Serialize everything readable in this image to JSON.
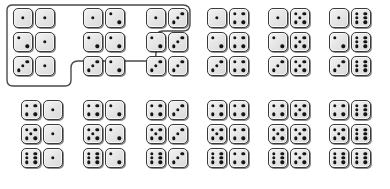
{
  "figure": {
    "type": "domino-set",
    "die_face_color": "#e9e9e9",
    "die_border_color": "#3a3a3a",
    "pip_color": "#141414",
    "outline_color": "#4a4a4a",
    "outline_fill": "none",
    "max_pips": 6,
    "domino_count": 28
  },
  "outline": {
    "name": "highlight-boundary",
    "description": "Rounded staircase outline enclosing the first twelve domino pairs in the upper block",
    "path": "M 7 10 Q 7 5 13 5 L 183 5 Q 190 5 190 12 L 190 24 Q 190 31 183 31 L 163 31 Q 156 31 156 38 L 156 54 Q 156 61 149 61 L 78 61 Q 71 61 71 68 L 71 80 Q 71 86 65 86 L 13 86 Q 7 86 7 80 Z"
  },
  "grid": {
    "top_block": {
      "rows": 3,
      "groups": [
        {
          "name": "group-ones",
          "x": 12,
          "y": 8,
          "pairs": [
            {
              "left": 1,
              "right": 1
            },
            {
              "left": 2,
              "right": 1
            },
            {
              "left": 3,
              "right": 1
            }
          ]
        },
        {
          "name": "group-twos",
          "x": 82,
          "y": 8,
          "pairs": [
            {
              "left": 1,
              "right": 2
            },
            {
              "left": 2,
              "right": 2
            },
            {
              "left": 3,
              "right": 2
            }
          ]
        },
        {
          "name": "group-threes",
          "x": 145,
          "y": 8,
          "pairs": [
            {
              "left": 1,
              "right": 3
            },
            {
              "left": 2,
              "right": 3
            },
            {
              "left": 3,
              "right": 3
            }
          ]
        },
        {
          "name": "group-fours",
          "x": 206,
          "y": 8,
          "pairs": [
            {
              "left": 1,
              "right": 4
            },
            {
              "left": 2,
              "right": 4
            },
            {
              "left": 3,
              "right": 4
            }
          ]
        },
        {
          "name": "group-fives",
          "x": 267,
          "y": 8,
          "pairs": [
            {
              "left": 1,
              "right": 5
            },
            {
              "left": 2,
              "right": 5
            },
            {
              "left": 3,
              "right": 5
            }
          ]
        },
        {
          "name": "group-sixes",
          "x": 328,
          "y": 8,
          "pairs": [
            {
              "left": 1,
              "right": 6
            },
            {
              "left": 2,
              "right": 6
            },
            {
              "left": 3,
              "right": 6
            }
          ]
        }
      ]
    },
    "bottom_block": {
      "rows": 3,
      "groups": [
        {
          "name": "group-ones-lower",
          "x": 20,
          "y": 100,
          "pairs": [
            {
              "left": 4,
              "right": 1
            },
            {
              "left": 5,
              "right": 1
            },
            {
              "left": 6,
              "right": 1
            }
          ]
        },
        {
          "name": "group-twos-lower",
          "x": 82,
          "y": 100,
          "pairs": [
            {
              "left": 4,
              "right": 2
            },
            {
              "left": 5,
              "right": 2
            },
            {
              "left": 6,
              "right": 2
            }
          ]
        },
        {
          "name": "group-threes-lower",
          "x": 145,
          "y": 100,
          "pairs": [
            {
              "left": 4,
              "right": 3
            },
            {
              "left": 5,
              "right": 3
            },
            {
              "left": 6,
              "right": 3
            }
          ]
        },
        {
          "name": "group-fours-lower",
          "x": 206,
          "y": 100,
          "pairs": [
            {
              "left": 4,
              "right": 4
            },
            {
              "left": 5,
              "right": 4
            },
            {
              "left": 6,
              "right": 4
            }
          ]
        },
        {
          "name": "group-fives-lower",
          "x": 267,
          "y": 100,
          "pairs": [
            {
              "left": 4,
              "right": 5
            },
            {
              "left": 5,
              "right": 5
            },
            {
              "left": 6,
              "right": 5
            }
          ]
        },
        {
          "name": "group-sixes-lower",
          "x": 328,
          "y": 100,
          "pairs": [
            {
              "left": 4,
              "right": 6
            },
            {
              "left": 5,
              "right": 6
            },
            {
              "left": 6,
              "right": 6
            }
          ]
        }
      ]
    }
  },
  "pip_layouts": {
    "1": [
      "mc"
    ],
    "2": [
      "tl",
      "br"
    ],
    "3": [
      "bl",
      "mc",
      "tr"
    ],
    "4": [
      "tl",
      "tr",
      "bl",
      "br"
    ],
    "5": [
      "tl",
      "tr",
      "mc",
      "bl",
      "br"
    ],
    "6": [
      "tl",
      "ml",
      "bl",
      "tr",
      "mr",
      "br"
    ]
  }
}
